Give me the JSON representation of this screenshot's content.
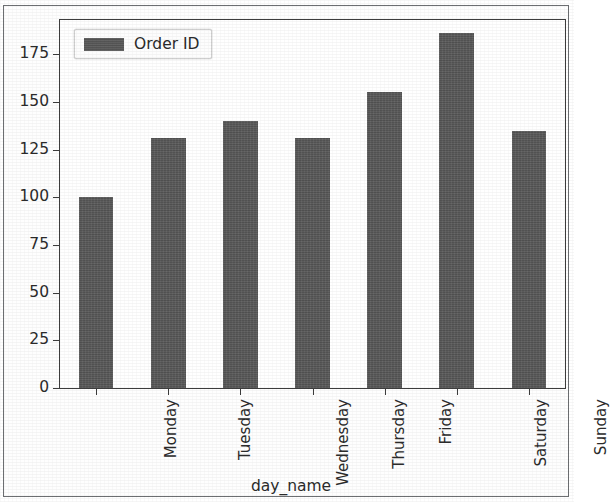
{
  "chart_data": {
    "type": "bar",
    "title": "",
    "subtitle": "",
    "xlabel": "day_name",
    "ylabel": "",
    "categories": [
      "Monday",
      "Tuesday",
      "Wednesday",
      "Thursday",
      "Friday",
      "Saturday",
      "Sunday"
    ],
    "values": [
      100,
      131,
      140,
      131,
      155,
      186,
      135
    ],
    "series": [
      {
        "name": "Order ID",
        "values": [
          100,
          131,
          140,
          131,
          155,
          186,
          135
        ],
        "color": "#595959"
      }
    ],
    "ylim": [
      0,
      193
    ],
    "yticks": [
      0,
      25,
      50,
      75,
      100,
      125,
      150,
      175
    ],
    "ytick_labels": [
      "0",
      "25",
      "50",
      "75",
      "100",
      "125",
      "150",
      "175"
    ],
    "xtick_labels": [
      "Monday",
      "Tuesday",
      "Wednesday",
      "Thursday",
      "Friday",
      "Saturday",
      "Sunday"
    ],
    "xtick_rotation": 90,
    "grid": false,
    "legend": {
      "visible": true,
      "position": "upper left",
      "entries": [
        {
          "label": "Order ID",
          "color": "#595959"
        }
      ]
    },
    "colors": {
      "bar": "#595959",
      "axis": "#3d3d3d",
      "text": "#2b2b2b",
      "background": "#ffffff",
      "frame": "#6d6f72"
    }
  }
}
